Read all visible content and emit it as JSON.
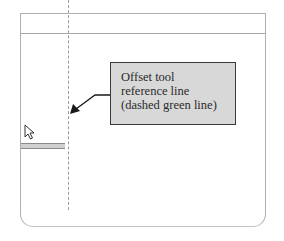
{
  "canvas": {
    "frame_color": "#b0b0b0",
    "reference_line_style": "dashed"
  },
  "callout": {
    "lines": [
      "Offset tool",
      "reference line",
      "(dashed green line)"
    ],
    "fill_color": "#d8d8d8",
    "border_color": "#3a3a3a"
  },
  "cursor": {
    "icon": "arrow-pointer-icon"
  },
  "tooltip": {
    "text": ""
  }
}
